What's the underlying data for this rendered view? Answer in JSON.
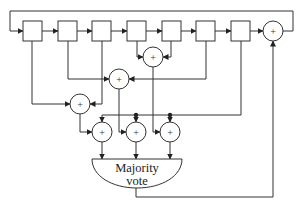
{
  "diagram": {
    "register_cells": 7,
    "xor_symbol": "+",
    "vote_block": {
      "line1": "Majority",
      "line2": "vote"
    },
    "colors": {
      "stroke": "#333333",
      "background": "#ffffff"
    }
  }
}
